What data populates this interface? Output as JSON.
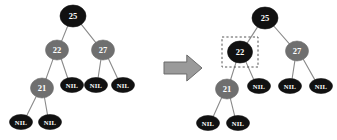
{
  "figure": {
    "background_color": "#ffffff",
    "colors": {
      "black_node": "#111111",
      "gray_node": "#6f6f6f",
      "node_text": "#ffffff",
      "edge": "#8a8a8a",
      "arrow_fill": "#9a9a9a",
      "arrow_stroke": "#6b6b6b",
      "highlight_dash": "#555555"
    },
    "nil_label": "NIL"
  },
  "left_tree": {
    "name": "before-tree",
    "nodes": [
      {
        "id": "l-25",
        "label": "25",
        "color": "black",
        "cx": 73,
        "cy": 16,
        "rx": 13,
        "ry": 11
      },
      {
        "id": "l-22",
        "label": "22",
        "color": "gray",
        "cx": 57,
        "cy": 50,
        "rx": 11.5,
        "ry": 10
      },
      {
        "id": "l-27",
        "label": "27",
        "color": "gray",
        "cx": 103,
        "cy": 50,
        "rx": 11.5,
        "ry": 10
      },
      {
        "id": "l-21",
        "label": "21",
        "color": "gray",
        "cx": 42,
        "cy": 88,
        "rx": 11.5,
        "ry": 10
      },
      {
        "id": "l-nil-1",
        "label": "NIL",
        "color": "black",
        "cx": 72,
        "cy": 85,
        "rx": 11.5,
        "ry": 7.5
      },
      {
        "id": "l-nil-2",
        "label": "NIL",
        "color": "black",
        "cx": 96,
        "cy": 85,
        "rx": 11.5,
        "ry": 7.5
      },
      {
        "id": "l-nil-3",
        "label": "NIL",
        "color": "black",
        "cx": 123,
        "cy": 85,
        "rx": 11.5,
        "ry": 7.5
      },
      {
        "id": "l-nil-4",
        "label": "NIL",
        "color": "black",
        "cx": 21,
        "cy": 122,
        "rx": 11.5,
        "ry": 7.5
      },
      {
        "id": "l-nil-5",
        "label": "NIL",
        "color": "black",
        "cx": 50,
        "cy": 122,
        "rx": 11.5,
        "ry": 7.5
      }
    ],
    "edges": [
      {
        "from": "l-25",
        "to": "l-22"
      },
      {
        "from": "l-25",
        "to": "l-27"
      },
      {
        "from": "l-22",
        "to": "l-21"
      },
      {
        "from": "l-22",
        "to": "l-nil-1"
      },
      {
        "from": "l-27",
        "to": "l-nil-2"
      },
      {
        "from": "l-27",
        "to": "l-nil-3"
      },
      {
        "from": "l-21",
        "to": "l-nil-4"
      },
      {
        "from": "l-21",
        "to": "l-nil-5"
      }
    ]
  },
  "arrow": {
    "name": "transform-arrow",
    "x": 164,
    "y": 55,
    "width": 38,
    "height": 26
  },
  "right_tree": {
    "name": "after-tree",
    "nodes": [
      {
        "id": "r-25",
        "label": "25",
        "color": "black",
        "cx": 265,
        "cy": 18,
        "rx": 13,
        "ry": 11
      },
      {
        "id": "r-22",
        "label": "22",
        "color": "black",
        "cx": 240,
        "cy": 52,
        "rx": 12.5,
        "ry": 11
      },
      {
        "id": "r-27",
        "label": "27",
        "color": "gray",
        "cx": 297,
        "cy": 51,
        "rx": 11.5,
        "ry": 10
      },
      {
        "id": "r-21",
        "label": "21",
        "color": "gray",
        "cx": 227,
        "cy": 89,
        "rx": 11.5,
        "ry": 10
      },
      {
        "id": "r-nil-1",
        "label": "NIL",
        "color": "black",
        "cx": 259,
        "cy": 86,
        "rx": 11.5,
        "ry": 7.5
      },
      {
        "id": "r-nil-2",
        "label": "NIL",
        "color": "black",
        "cx": 290,
        "cy": 86,
        "rx": 11.5,
        "ry": 7.5
      },
      {
        "id": "r-nil-3",
        "label": "NIL",
        "color": "black",
        "cx": 321,
        "cy": 86,
        "rx": 11.5,
        "ry": 7.5
      },
      {
        "id": "r-nil-4",
        "label": "NIL",
        "color": "black",
        "cx": 208,
        "cy": 123,
        "rx": 11.5,
        "ry": 7.5
      },
      {
        "id": "r-nil-5",
        "label": "NIL",
        "color": "black",
        "cx": 238,
        "cy": 123,
        "rx": 11.5,
        "ry": 7.5
      }
    ],
    "edges": [
      {
        "from": "r-25",
        "to": "r-22"
      },
      {
        "from": "r-25",
        "to": "r-27"
      },
      {
        "from": "r-22",
        "to": "r-21"
      },
      {
        "from": "r-22",
        "to": "r-nil-1"
      },
      {
        "from": "r-27",
        "to": "r-nil-2"
      },
      {
        "from": "r-27",
        "to": "r-nil-3"
      },
      {
        "from": "r-21",
        "to": "r-nil-4"
      },
      {
        "from": "r-21",
        "to": "r-nil-5"
      }
    ],
    "highlight_box": {
      "name": "highlight-box-node-22",
      "x": 222,
      "y": 37,
      "width": 36,
      "height": 30
    }
  }
}
